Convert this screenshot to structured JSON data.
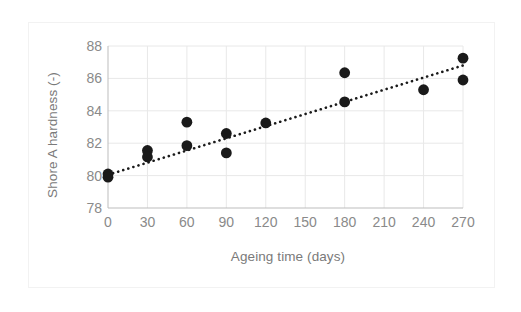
{
  "chart_data": {
    "type": "scatter",
    "title": "",
    "xlabel": "Ageing time (days)",
    "ylabel": "Shore A hardness (-)",
    "xlim": [
      0,
      270
    ],
    "ylim": [
      78,
      88
    ],
    "xticks": [
      0,
      30,
      60,
      90,
      120,
      150,
      180,
      210,
      240,
      270
    ],
    "yticks": [
      78,
      80,
      82,
      84,
      86,
      88
    ],
    "grid": true,
    "legend": "none",
    "marker_color": "#1a1a1a",
    "trend_color": "#1a1a1a",
    "grid_color": "#e8e8e8",
    "axis_text_color": "#8a8a8a",
    "series": [
      {
        "name": "Shore A hardness",
        "marker": "filled-circle",
        "points": [
          {
            "x": 0,
            "y": 80.1
          },
          {
            "x": 0,
            "y": 79.9
          },
          {
            "x": 30,
            "y": 81.55
          },
          {
            "x": 30,
            "y": 81.15
          },
          {
            "x": 60,
            "y": 83.3
          },
          {
            "x": 60,
            "y": 81.85
          },
          {
            "x": 90,
            "y": 82.6
          },
          {
            "x": 90,
            "y": 81.4
          },
          {
            "x": 120,
            "y": 83.25
          },
          {
            "x": 180,
            "y": 86.35
          },
          {
            "x": 180,
            "y": 84.55
          },
          {
            "x": 240,
            "y": 85.3
          },
          {
            "x": 270,
            "y": 87.25
          },
          {
            "x": 270,
            "y": 85.9
          }
        ]
      }
    ],
    "trendline": {
      "style": "dotted",
      "x_start": 0,
      "y_start": 80.05,
      "x_end": 270,
      "y_end": 86.8
    }
  },
  "axes": {
    "x_tick_labels": [
      "0",
      "30",
      "60",
      "90",
      "120",
      "150",
      "180",
      "210",
      "240",
      "270"
    ],
    "y_tick_labels": [
      "78",
      "80",
      "82",
      "84",
      "86",
      "88"
    ],
    "x_title": "Ageing time (days)",
    "y_title": "Shore A hardness (-)"
  }
}
